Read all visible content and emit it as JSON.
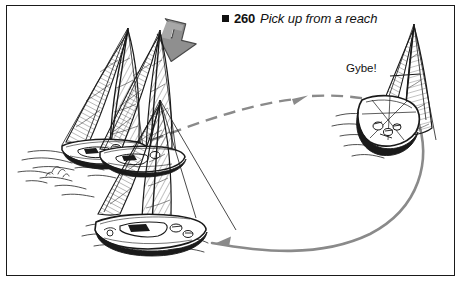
{
  "figure": {
    "caption": {
      "bullet": "filled-square-bullet",
      "number": "260",
      "title": "Pick up from a reach"
    },
    "annotations": {
      "gybe": "Gybe!"
    },
    "colors": {
      "ink": "#111111",
      "frame": "#1a1a1a",
      "track": "#8a8a8a",
      "wind_arrow_fill": "#8f8f8f",
      "wind_arrow_stroke": "#5a5a5a",
      "background": "#ffffff"
    },
    "elements": {
      "wind_arrow": "wind-direction-arrow",
      "outbound_track": "dashed-track-arrow",
      "return_track": "solid-track-arrow",
      "boat_left_far": "sailboat-upwind-far",
      "boat_left_near": "sailboat-upwind-near",
      "boat_lower": "sailboat-reaching",
      "boat_right": "sailboat-stern-view"
    }
  }
}
